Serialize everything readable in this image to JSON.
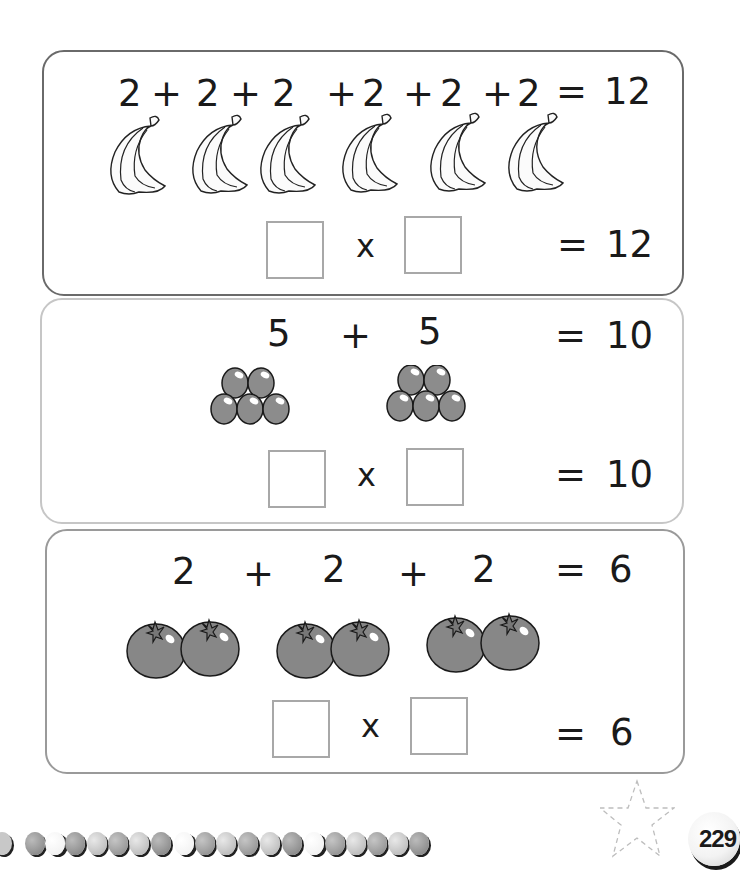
{
  "page": {
    "number": "229"
  },
  "exercises": [
    {
      "fruit": "banana",
      "addition_tokens": [
        "2",
        "+",
        "2",
        "+",
        "2",
        "+",
        "2",
        "+",
        "2",
        "+",
        "2",
        "=",
        "12"
      ],
      "fruit_count": 6,
      "multiply_sign": "x",
      "multiply_equals": "=",
      "multiply_result": "12",
      "answer_boxes": [
        "",
        ""
      ]
    },
    {
      "fruit": "grape-bunch",
      "addition_tokens": [
        "5",
        "+",
        "5",
        "=",
        "10"
      ],
      "fruit_count": 2,
      "multiply_sign": "x",
      "multiply_equals": "=",
      "multiply_result": "10",
      "answer_boxes": [
        "",
        ""
      ]
    },
    {
      "fruit": "tomato-pair",
      "addition_tokens": [
        "2",
        "+",
        "2",
        "+",
        "2",
        "=",
        "6"
      ],
      "fruit_count": 3,
      "multiply_sign": "x",
      "multiply_equals": "=",
      "multiply_result": "6",
      "answer_boxes": [
        "",
        ""
      ]
    }
  ],
  "decoration": {
    "bead_row": "bead-icon",
    "star": "star-outline-icon"
  },
  "colors": {
    "text": "#1a1a1a",
    "fruit_fill": "#8a8a8a",
    "box_border": "#a8a8a8",
    "panel1_border": "#6a6a6a",
    "panel2_border": "#c6c6c6",
    "panel3_border": "#9a9a9a"
  }
}
